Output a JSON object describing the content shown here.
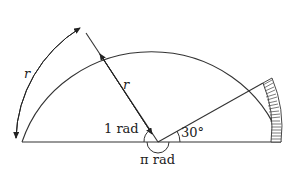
{
  "diagram": {
    "type": "semicircle-radian-illustration",
    "labels": {
      "arc_length": "r",
      "radius": "r",
      "one_radian": "1 rad",
      "pi_radian": "π rad",
      "thirty_degrees": "30°"
    },
    "colors": {
      "stroke": "#333333",
      "background": "#ffffff"
    }
  }
}
